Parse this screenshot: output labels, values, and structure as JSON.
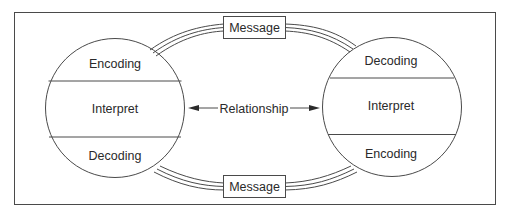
{
  "diagram": {
    "type": "communication-model",
    "left_party": {
      "sections": [
        {
          "label": "Encoding"
        },
        {
          "label": "Interpret"
        },
        {
          "label": "Decoding"
        }
      ]
    },
    "right_party": {
      "sections": [
        {
          "label": "Decoding"
        },
        {
          "label": "Interpret"
        },
        {
          "label": "Encoding"
        }
      ]
    },
    "top_message": {
      "label": "Message"
    },
    "bottom_message": {
      "label": "Message"
    },
    "relationship": {
      "label": "Relationship"
    },
    "colors": {
      "line": "#4a4a4a",
      "text": "#2a2a2a",
      "background": "#ffffff"
    }
  }
}
